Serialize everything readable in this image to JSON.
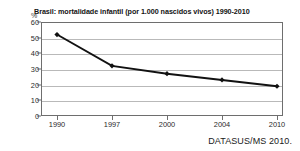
{
  "chart_data": {
    "type": "line",
    "title": "Brasil: mortalidade infantil (por 1.000 nascidos vivos) 1990-2010",
    "xlabel": "",
    "ylabel": "%",
    "unit_label": "%",
    "categories": [
      "1990",
      "1997",
      "2000",
      "2004",
      "2010"
    ],
    "x": [
      1990,
      1997,
      2000,
      2004,
      2010
    ],
    "values": [
      52,
      32,
      27,
      23,
      19
    ],
    "series": [
      {
        "name": "mortalidade infantil",
        "values": [
          52,
          32,
          27,
          23,
          19
        ]
      }
    ],
    "ylim": [
      0,
      60
    ],
    "yticks": [
      0,
      10,
      20,
      30,
      40,
      50,
      60
    ],
    "ytick_labels": [
      "0",
      "10",
      "20",
      "30",
      "40",
      "50",
      "60"
    ],
    "grid": true,
    "legend": false,
    "legend_position": "none",
    "line_color": "#111111",
    "marker": "diamond",
    "marker_color": "#111111",
    "source_note": "DATASUS/MS 2010."
  }
}
